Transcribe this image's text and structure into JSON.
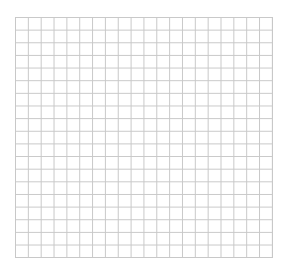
{
  "grid": {
    "columns": 20,
    "rows": 19,
    "line_color": "#c8c8c8",
    "background_color": "#ffffff"
  }
}
